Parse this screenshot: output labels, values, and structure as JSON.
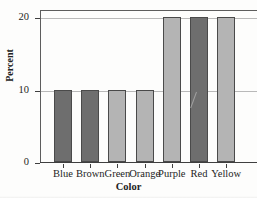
{
  "chart_data": {
    "type": "bar",
    "title": "Plain Colorful M&M's",
    "xlabel": "Color",
    "ylabel": "Percent",
    "categories": [
      "Blue",
      "Brown",
      "Green",
      "Orange",
      "Purple",
      "Red",
      "Yellow"
    ],
    "values": [
      10,
      10,
      10,
      10,
      20,
      20,
      20
    ],
    "bar_shades": [
      "#6e6e6e",
      "#6e6e6e",
      "#b4b4b4",
      "#b4b4b4",
      "#b4b4b4",
      "#6e6e6e",
      "#b4b4b4"
    ],
    "ylim": [
      0,
      20
    ],
    "yticks": [
      0,
      10,
      20
    ],
    "ytick_labels": [
      "0",
      "10",
      "20"
    ],
    "grid": true,
    "grid_axis": "y",
    "legend": false,
    "bar_edge_color": "#4a4a4a",
    "grid_color": "#b9b9b9",
    "axis_color": "#3f3f3f",
    "background": "#fdfdfc"
  }
}
